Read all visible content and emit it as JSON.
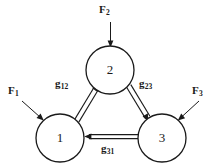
{
  "diagram": {
    "type": "three-node-force-flow-triangle",
    "nodes": [
      {
        "id": "node-1",
        "label": "1",
        "cx": 60,
        "cy": 138,
        "r": 24
      },
      {
        "id": "node-2",
        "label": "2",
        "cx": 110,
        "cy": 70,
        "r": 24
      },
      {
        "id": "node-3",
        "label": "3",
        "cx": 162,
        "cy": 138,
        "r": 24
      }
    ],
    "external_forces": [
      {
        "id": "force-1",
        "symbol": "F",
        "subscript": "1",
        "position": "upper-left",
        "direction": "down-right"
      },
      {
        "id": "force-2",
        "symbol": "F",
        "subscript": "2",
        "position": "top",
        "direction": "down"
      },
      {
        "id": "force-3",
        "symbol": "F",
        "subscript": "3",
        "position": "upper-right",
        "direction": "down-left"
      }
    ],
    "edges": [
      {
        "id": "edge-g12",
        "symbol": "g",
        "subscript": "12",
        "from": "1",
        "to": "2",
        "style": "double-line"
      },
      {
        "id": "edge-g23",
        "symbol": "g",
        "subscript": "23",
        "from": "2",
        "to": "3",
        "style": "double-line"
      },
      {
        "id": "edge-g31",
        "symbol": "g",
        "subscript": "31",
        "from": "3",
        "to": "1",
        "style": "double-line"
      }
    ],
    "colors": {
      "stroke": "#1a1a1a",
      "fill": "#ffffff",
      "background": "#ffffff"
    }
  }
}
